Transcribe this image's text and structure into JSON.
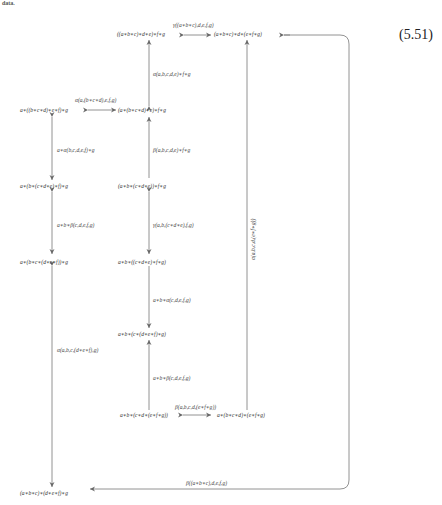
{
  "header": {
    "fragment": "data."
  },
  "equation_number": "(5.51)",
  "nodes": {
    "n1": "((a∗b∗c)∗d∗e)∗f∗g",
    "n2": "(a∗b∗c)∗d∗(e∗f∗g)",
    "n3": "a∗((b∗c∗d)∗e∗f)∗g",
    "n4": "(a∗(b∗c∗d)∗e)∗f∗g",
    "n5": "a∗(b∗(c∗d∗e)∗f)∗g",
    "n6": "(a∗b∗(c∗d∗e))∗f∗g",
    "n7": "a∗(b∗c∗(d∗e∗f))∗g",
    "n8": "a∗b∗((c∗d∗e)∗f∗g)",
    "n9": "a∗b∗(c∗(d∗e∗f)∗g)",
    "n10": "a∗b∗(c∗d∗(e∗f∗g))",
    "n11": "a∗(b∗c∗d)∗(e∗f∗g)",
    "n12": "(a∗b∗c)∗(d∗e∗f)∗g"
  },
  "labels": {
    "gamma_top": "γ((a∗b∗c),d,e,f,g)",
    "alpha_abcde": "α(a,b,c,d,e)∗f∗g",
    "alpha_a_bcd": "α(a,(b∗c∗d),e,f,g)",
    "a_alpha_bcdef": "a∗α(b,c,d,e,f)∗g",
    "beta_abcde": "β(a,b,c,d,e)∗f∗g",
    "ab_beta_cdefg": "a∗b∗β(c,d,e,f,g)",
    "gamma_ab_cde": "γ(a,b,(c∗d∗e),f,g)",
    "alpha_abcd_efg": "α(a,b,c,d,(e∗f∗g))",
    "ab_alpha_cdefg": "a∗b∗α(c,d,e,f,g)",
    "alpha_abc_def": "α(a,b,c,(d∗e∗f),g)",
    "ab_beta2": "a∗b∗β(c,d,e,f,g)",
    "beta_abcd_efg": "β(a,b,c,d,(e∗f∗g))",
    "beta_bottom": "β((a∗b∗c),d,e,f,g)"
  },
  "colors": {
    "line": "#777777",
    "text": "#333333"
  }
}
